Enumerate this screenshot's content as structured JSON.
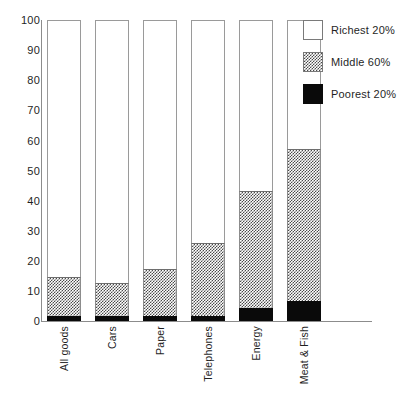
{
  "chart_data": {
    "type": "bar",
    "subtype": "stacked-100-percent",
    "title": "",
    "subtitle": "",
    "xlabel": "",
    "ylabel": "",
    "ylim": [
      0,
      100
    ],
    "yticks": [
      0,
      10,
      20,
      30,
      40,
      50,
      60,
      70,
      80,
      90,
      100
    ],
    "ytick_labels": [
      "0",
      "10",
      "20",
      "30",
      "40",
      "50",
      "60",
      "70",
      "80",
      "90",
      "100"
    ],
    "grid": false,
    "legend_position": "top-right",
    "categories": [
      "All goods",
      "Cars",
      "Paper",
      "Telephones",
      "Energy",
      "Meat & Fish"
    ],
    "series": [
      {
        "name": "Poorest 20%",
        "color": "#0a0a0a",
        "fill": "solid-black",
        "values": [
          1.7,
          1.7,
          1.7,
          1.7,
          4.3,
          6.5
        ]
      },
      {
        "name": "Middle 60%",
        "color": "#4a4a4a",
        "fill": "checkerboard-gray",
        "values": [
          13.0,
          11.0,
          15.6,
          24.3,
          39.0,
          50.8
        ]
      },
      {
        "name": "Richest 20%",
        "color": "#ffffff",
        "fill": "white",
        "values": [
          85.3,
          87.3,
          82.7,
          74.0,
          56.7,
          42.7
        ]
      }
    ],
    "cumulative_tops": {
      "poorest_20": [
        1.7,
        1.7,
        1.7,
        1.7,
        4.3,
        6.5
      ],
      "middle_60": [
        14.7,
        12.7,
        17.3,
        26.0,
        43.3,
        57.3
      ],
      "richest_20": [
        100,
        100,
        100,
        100,
        100,
        100
      ]
    }
  },
  "legend": {
    "items": [
      {
        "label": "Richest 20%",
        "swatch": "white-swatch"
      },
      {
        "label": "Middle 60%",
        "swatch": "gray-hatch-swatch"
      },
      {
        "label": "Poorest 20%",
        "swatch": "black-swatch"
      }
    ]
  },
  "axes": {
    "y_tick_labels": [
      "100",
      "90",
      "80",
      "70",
      "60",
      "50",
      "40",
      "30",
      "20",
      "10",
      "0"
    ],
    "x_category_labels": [
      "All goods",
      "Cars",
      "Paper",
      "Telephones",
      "Energy",
      "Meat & Fish"
    ]
  },
  "colors": {
    "black": "#0a0a0a",
    "gray_hatch": "#4a4a4a",
    "white": "#ffffff",
    "axis": "#8c8c8c",
    "text": "#1f1f1f"
  }
}
